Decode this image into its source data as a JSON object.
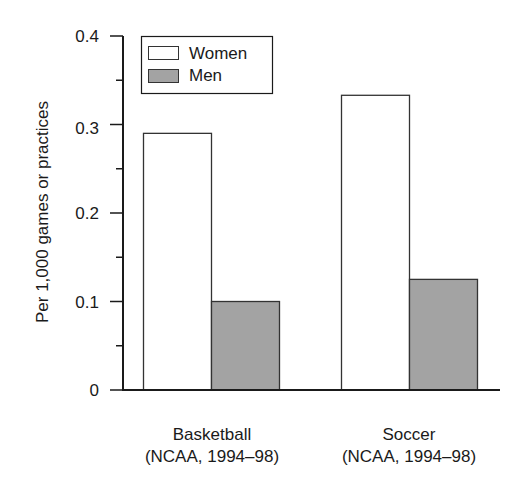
{
  "chart_data": {
    "type": "bar",
    "title": "",
    "xlabel": "",
    "ylabel": "Per 1,000 games or practices",
    "ylim": [
      0,
      0.4
    ],
    "yticks": [
      0,
      0.1,
      0.2,
      0.3,
      0.4
    ],
    "ytick_labels": [
      "0",
      "0.1",
      "0.2",
      "0.3",
      "0.4"
    ],
    "minor_yticks": [
      0.05,
      0.15,
      0.25,
      0.35
    ],
    "grid": false,
    "legend_position": "upper left",
    "categories": [
      {
        "line1": "Basketball",
        "line2": "(NCAA, 1994–98)"
      },
      {
        "line1": "Soccer",
        "line2": "(NCAA, 1994–98)"
      }
    ],
    "series": [
      {
        "name": "Women",
        "color": "#ffffff",
        "values": [
          0.29,
          0.333
        ]
      },
      {
        "name": "Men",
        "color": "#a3a3a3",
        "values": [
          0.1,
          0.125
        ]
      }
    ]
  },
  "colors": {
    "axis": "#1a1a1a",
    "bar_edge": "#333333"
  }
}
